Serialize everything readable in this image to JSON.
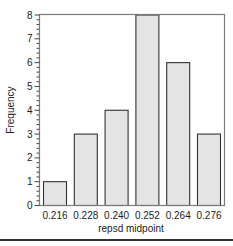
{
  "chart_data": {
    "type": "bar",
    "title": "",
    "xlabel": "repsd midpoint",
    "ylabel": "Frequency",
    "categories": [
      "0.216",
      "0.228",
      "0.240",
      "0.252",
      "0.264",
      "0.276"
    ],
    "values": [
      1,
      3,
      4,
      8,
      6,
      3
    ],
    "ylim": [
      0,
      8
    ],
    "yticks": [
      0,
      1,
      2,
      3,
      4,
      5,
      6,
      7,
      8
    ],
    "minor_ticks_per_unit": 4,
    "grid": false,
    "legend": null,
    "bar_fill": "#e4e4e4",
    "bar_stroke": "#333333",
    "frame_color": "#7a7a7a"
  }
}
